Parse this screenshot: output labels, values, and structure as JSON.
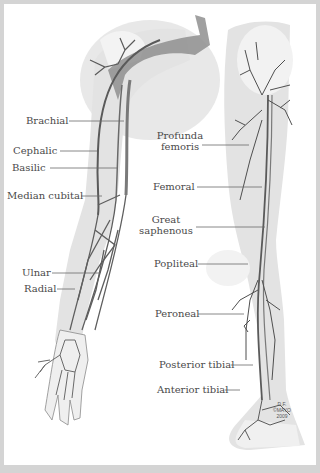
{
  "diagram": {
    "colors": {
      "frame": "#d4d4d4",
      "background": "#ffffff",
      "limb_fill": "#e3e3e3",
      "bone_fill": "#f4f4f4",
      "vein_dark": "#5a5a5a",
      "vein_mid": "#8a8a8a",
      "leader_line": "#6a6a6a",
      "label_text": "#4a4a4a"
    },
    "arm": {
      "labels": [
        {
          "id": "brachial",
          "text": "Brachial"
        },
        {
          "id": "cephalic",
          "text": "Cephalic"
        },
        {
          "id": "basilic",
          "text": "Basilic"
        },
        {
          "id": "median-cubital",
          "text": "Median cubital"
        },
        {
          "id": "ulnar",
          "text": "Ulnar"
        },
        {
          "id": "radial",
          "text": "Radial"
        }
      ]
    },
    "leg": {
      "labels": [
        {
          "id": "profunda-femoris",
          "line1": "Profunda",
          "line2": "femoris"
        },
        {
          "id": "femoral",
          "text": "Femoral"
        },
        {
          "id": "great-saphenous",
          "line1": "Great",
          "line2": "saphenous"
        },
        {
          "id": "popliteal",
          "text": "Popliteal"
        },
        {
          "id": "peroneal",
          "text": "Peroneal"
        },
        {
          "id": "posterior-tibial",
          "text": "Posterior tibial"
        },
        {
          "id": "anterior-tibial",
          "text": "Anterior tibial"
        }
      ]
    },
    "credit": {
      "line1": "D.F.",
      "line2": "©MAYO",
      "line3": "2009"
    }
  }
}
